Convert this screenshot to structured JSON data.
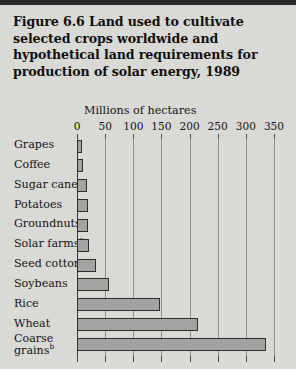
{
  "figure": {
    "title": "Figure 6.6  Land used to cultivate selected crops worldwide and hypothetical land requirements for production of solar energy, 1989",
    "background_color": "#d9d9d6",
    "bar_fill_color": "#a3a3a1",
    "bar_edge_color": "#2e2e2e"
  },
  "chart_data": {
    "type": "bar",
    "orientation": "horizontal",
    "title": "Figure 6.6  Land used to cultivate selected crops worldwide and hypothetical land requirements for production of solar energy, 1989",
    "xlabel": "Millions of hectares",
    "ylabel": "",
    "xlim": [
      0,
      350
    ],
    "xticks": [
      0,
      50,
      100,
      150,
      200,
      250,
      300,
      350
    ],
    "xtick_labels": [
      "0",
      "50",
      "100",
      "150",
      "200",
      "250",
      "300",
      "350"
    ],
    "grid": true,
    "grid_axis": "x",
    "legend": false,
    "categories": [
      "Grapes",
      "Coffee",
      "Sugar cane",
      "Potatoes",
      "Groundnuts",
      "Solar farms",
      "Seed cotton",
      "Soybeans",
      "Rice",
      "Wheat",
      "Coarse grains"
    ],
    "category_footnotes": [
      "",
      "",
      "",
      "",
      "",
      "a",
      "",
      "",
      "",
      "",
      "b"
    ],
    "values": [
      9,
      11,
      17,
      19,
      20,
      22,
      33,
      57,
      148,
      215,
      335
    ],
    "units": "millions of hectares"
  }
}
